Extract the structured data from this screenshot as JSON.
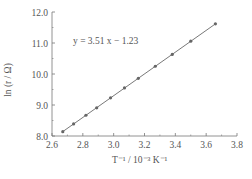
{
  "chart_data": {
    "type": "scatter",
    "title": "",
    "xlabel": "T⁻¹ / 10⁻³ K⁻¹",
    "ylabel": "ln (r / Ω)",
    "xlim": [
      2.6,
      3.8
    ],
    "ylim": [
      8.0,
      12.0
    ],
    "xticks": [
      "2.6",
      "2.8",
      "3.0",
      "3.2",
      "3.4",
      "3.6",
      "3.8"
    ],
    "yticks": [
      "8.0",
      "9.0",
      "10.0",
      "11.0",
      "12.0"
    ],
    "grid": false,
    "series": [
      {
        "name": "data",
        "x": [
          2.67,
          2.74,
          2.82,
          2.89,
          2.98,
          3.07,
          3.16,
          3.27,
          3.38,
          3.5,
          3.66
        ],
        "y": [
          8.14,
          8.39,
          8.67,
          8.91,
          9.23,
          9.55,
          9.86,
          10.25,
          10.63,
          11.06,
          11.62
        ]
      }
    ],
    "fit_line": {
      "slope": 3.51,
      "intercept": -1.23,
      "x_range": [
        2.67,
        3.66
      ]
    },
    "annotations": [
      {
        "text": "y = 3.51 x − 1.23",
        "x": 2.73,
        "y": 11.8
      }
    ]
  },
  "labels": {
    "equation": "y = 3.51 x − 1.23",
    "xlabel": "T⁻¹ / 10⁻³ K⁻¹",
    "ylabel": "ln (r / Ω)"
  }
}
